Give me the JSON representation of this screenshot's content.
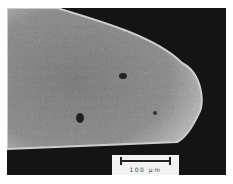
{
  "image": {
    "description": "SEM micrograph of rounded fiber tip",
    "colors": {
      "background": "#141414",
      "specimen": "#8a8a8a",
      "edge": "#d8d8d8"
    }
  },
  "scale_bar": {
    "label": "100 μm"
  }
}
